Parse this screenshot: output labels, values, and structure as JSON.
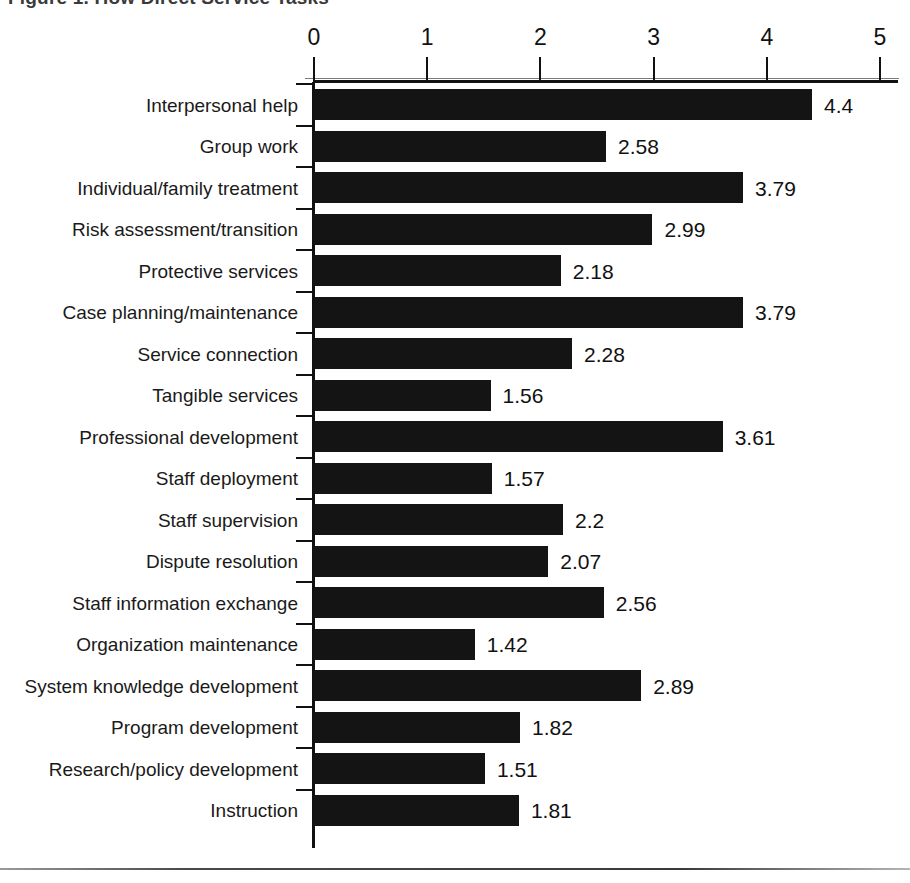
{
  "title": "Figure 1. How Direct Service Tasks",
  "axis": {
    "ticks": [
      "0",
      "1",
      "2",
      "3",
      "4",
      "5"
    ],
    "min": 0,
    "max": 5
  },
  "chart_data": {
    "type": "bar",
    "orientation": "horizontal",
    "title": "Figure 1. How Direct Service Tasks",
    "xlabel": "",
    "ylabel": "",
    "xlim": [
      0,
      5
    ],
    "grid": false,
    "legend": false,
    "tick_labels": [
      "0",
      "1",
      "2",
      "3",
      "4",
      "5"
    ],
    "bar_color": "#141414",
    "categories": [
      "Interpersonal help",
      "Group work",
      "Individual/family treatment",
      "Risk assessment/transition",
      "Protective services",
      "Case planning/maintenance",
      "Service connection",
      "Tangible services",
      "Professional development",
      "Staff deployment",
      "Staff supervision",
      "Dispute resolution",
      "Staff information exchange",
      "Organization maintenance",
      "System knowledge development",
      "Program development",
      "Research/policy development",
      "Instruction"
    ],
    "values": [
      4.4,
      2.58,
      3.79,
      2.99,
      2.18,
      3.79,
      2.28,
      1.56,
      3.61,
      1.57,
      2.2,
      2.07,
      2.56,
      1.42,
      2.89,
      1.82,
      1.51,
      1.81
    ],
    "value_labels": [
      "4.4",
      "2.58",
      "3.79",
      "2.99",
      "2.18",
      "3.79",
      "2.28",
      "1.56",
      "3.61",
      "1.57",
      "2.2",
      "2.07",
      "2.56",
      "1.42",
      "2.89",
      "1.82",
      "1.51",
      "1.81"
    ]
  }
}
